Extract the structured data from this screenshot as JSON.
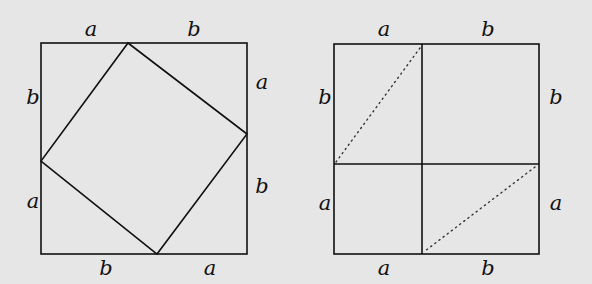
{
  "background": "#e6e6e6",
  "stroke": "#111111",
  "left_figure": {
    "outer_square": {
      "x": 41,
      "y": 43,
      "w": 206,
      "h": 211
    },
    "inner_square": [
      [
        128,
        43
      ],
      [
        247,
        134
      ],
      [
        157,
        254
      ],
      [
        41,
        161
      ]
    ],
    "labels": [
      {
        "text": "a",
        "x": 91,
        "y": 36
      },
      {
        "text": "b",
        "x": 194,
        "y": 36
      },
      {
        "text": "a",
        "x": 262,
        "y": 89
      },
      {
        "text": "b",
        "x": 262,
        "y": 193
      },
      {
        "text": "b",
        "x": 106,
        "y": 275
      },
      {
        "text": "a",
        "x": 210,
        "y": 275
      },
      {
        "text": "b",
        "x": 33,
        "y": 104
      },
      {
        "text": "a",
        "x": 33,
        "y": 208
      }
    ]
  },
  "right_figure": {
    "outer_square": {
      "x": 334,
      "y": 44,
      "w": 205,
      "h": 210
    },
    "divider_x": 422,
    "divider_y": 164,
    "dotted_lines": [
      [
        [
          420,
          48
        ],
        [
          336,
          162
        ]
      ],
      [
        [
          535,
          167
        ],
        [
          425,
          251
        ]
      ]
    ],
    "labels": [
      {
        "text": "a",
        "x": 384,
        "y": 36
      },
      {
        "text": "b",
        "x": 488,
        "y": 36
      },
      {
        "text": "b",
        "x": 325,
        "y": 104
      },
      {
        "text": "a",
        "x": 325,
        "y": 210
      },
      {
        "text": "b",
        "x": 556,
        "y": 104
      },
      {
        "text": "a",
        "x": 556,
        "y": 210
      },
      {
        "text": "a",
        "x": 384,
        "y": 275
      },
      {
        "text": "b",
        "x": 488,
        "y": 275
      }
    ]
  }
}
